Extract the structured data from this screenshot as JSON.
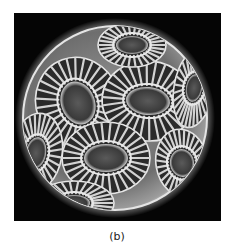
{
  "figure": {
    "caption": "(b)",
    "image_alt": "Scanning electron micrograph of a coccolithophore cell covered with interlocking coccolith plates"
  },
  "colors": {
    "background": "#050505",
    "sphere_glow": "#d8d8d8",
    "plate": "#c8c8c8",
    "plate_shadow": "#1a1a1a"
  }
}
